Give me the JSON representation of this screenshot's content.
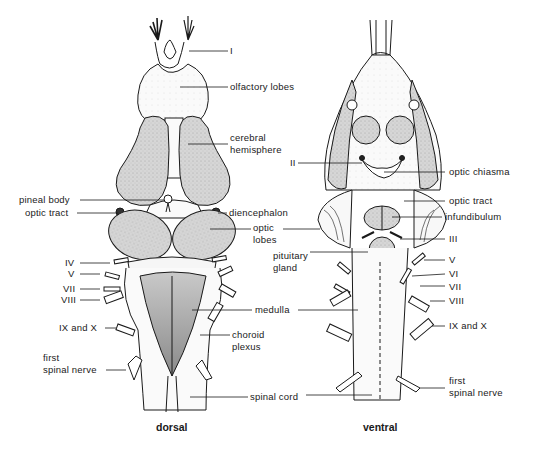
{
  "figure": {
    "colors": {
      "stroke": "#1a1a1a",
      "shaded": "#d4d4d4",
      "light": "#f4f4f4",
      "background": "#ffffff"
    }
  },
  "views": [
    {
      "name": "dorsal",
      "caption": "dorsal"
    },
    {
      "name": "ventral",
      "caption": "ventral"
    }
  ],
  "labels": {
    "dorsal_right": {
      "I": "I",
      "olfactory_lobes": "olfactory lobes",
      "cerebral_hemisphere_1": "cerebral",
      "cerebral_hemisphere_2": "hemisphere",
      "diencephalon": "diencephalon",
      "optic_lobes_1": "optic",
      "optic_lobes_2": "lobes",
      "medulla": "medulla",
      "choroid_plexus_1": "choroid",
      "choroid_plexus_2": "plexus",
      "spinal_cord": "spinal cord"
    },
    "dorsal_left": {
      "pineal_body": "pineal body",
      "optic_tract": "optic tract",
      "IV": "IV",
      "V": "V",
      "VII": "VII",
      "VIII": "VIII",
      "IX_and_X": "IX and X",
      "first_spinal_nerve_1": "first",
      "first_spinal_nerve_2": "spinal nerve"
    },
    "ventral_left": {
      "II": "II",
      "pituitary_gland_1": "pituitary",
      "pituitary_gland_2": "gland"
    },
    "ventral_right": {
      "optic_chiasma": "optic chiasma",
      "optic_tract": "optic tract",
      "infundibulum": "infundibulum",
      "III": "III",
      "V": "V",
      "VI": "VI",
      "VII": "VII",
      "VIII": "VIII",
      "IX_and_X": "IX and X",
      "first_spinal_nerve_1": "first",
      "first_spinal_nerve_2": "spinal nerve"
    }
  }
}
